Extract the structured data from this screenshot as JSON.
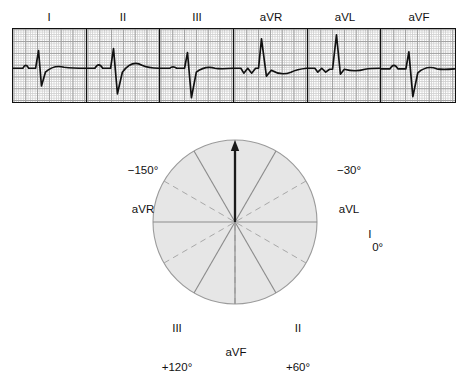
{
  "figure": {
    "type": "ecg-hexaxial-reference",
    "ecg_strip": {
      "lead_labels": [
        "I",
        "II",
        "III",
        "aVR",
        "aVL",
        "aVF"
      ],
      "panel_count": 6,
      "grid": {
        "small_square_px": 2.36,
        "large_square_px": 11.8,
        "minor_color": "#cfcfcf",
        "major_color": "#9a9a9a",
        "trace_color": "#111111",
        "border_color": "#111111"
      },
      "panels": [
        {
          "lead": "I",
          "description": "small P wave, tall narrow R wave, deep S wave, low rounded T wave",
          "qrs_net": "positive",
          "path": "M0,40 L10,40 Q13,34 16,40 L20,40 L23,40 L26,22 L29,58 L33,44 Q42,36 52,39 Q60,40 74,40"
        },
        {
          "lead": "II",
          "description": "small P wave, R wave, deep S wave, broad positive T wave",
          "qrs_net": "positive",
          "path": "M0,40 L8,40 Q12,33 16,40 L21,40 L24,40 L27,20 L31,66 L36,44 Q46,31 56,37 Q62,40 74,40"
        },
        {
          "lead": "III",
          "description": "flat P wave, small R wave, very deep S wave, small T wave",
          "qrs_net": "negative",
          "path": "M0,40 L10,40 Q13,37 17,40 L22,40 L25,40 L28,24 L32,70 L37,44 Q46,37 56,40 Q62,41 74,40"
        },
        {
          "lead": "aVR",
          "description": "small negative deflections then tall upright R wave, shallow negative T wave",
          "qrs_net": "positive",
          "path": "M0,40 L7,40 L10,45 L14,40 L18,45 L22,40 L25,40 L28,10 L33,48 L38,42 Q48,48 58,44 Q64,41 74,40"
        },
        {
          "lead": "aVL",
          "description": "small initial deflections then very tall narrow R wave, flat T wave",
          "qrs_net": "positive",
          "path": "M0,40 L7,40 L10,44 L14,40 L18,44 L22,41 L25,41 L29,6 L33,46 L37,41 Q48,44 58,41 Q64,40 74,40"
        },
        {
          "lead": "aVF",
          "description": "small P wave, R wave, deep S wave, low T wave",
          "qrs_net": "negative",
          "path": "M0,40 L9,40 Q13,33 17,40 L22,40 L25,40 L28,23 L32,68 L37,44 Q46,36 56,40 Q62,41 74,40"
        }
      ]
    },
    "hexaxial_circle": {
      "center": {
        "x": 235,
        "y": 222
      },
      "radius": 82,
      "fill_color": "#e6e6e6",
      "border_color": "#9b9b9b",
      "axis_line_color": "#8c8c8c",
      "dashed_line_color": "#a8a8a8",
      "vector_arrow_color": "#1a1a1a",
      "vector_arrow_angle_deg": -90,
      "vector_arrow_description": "thick black mean QRS axis arrow pointing straight up",
      "solid_axes_deg": [
        0,
        60,
        120,
        180,
        240,
        300
      ],
      "dashed_axes_deg": [
        30,
        90,
        150,
        210,
        270,
        330
      ],
      "labels": [
        {
          "id": "avr",
          "degrees": "−150°",
          "lead": "aVR",
          "angle_deg": -150
        },
        {
          "id": "avl",
          "degrees": "−30°",
          "lead": "aVL",
          "angle_deg": -30
        },
        {
          "id": "i",
          "degrees": "0°",
          "lead": "I",
          "angle_deg": 0
        },
        {
          "id": "ii",
          "degrees": "+60°",
          "lead": "II",
          "angle_deg": 60
        },
        {
          "id": "iii",
          "degrees": "+120°",
          "lead": "III",
          "angle_deg": 120
        },
        {
          "id": "avf",
          "degrees": "",
          "lead": "aVF",
          "angle_deg": 90
        }
      ]
    }
  }
}
